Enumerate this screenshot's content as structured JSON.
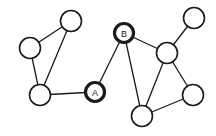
{
  "figure": {
    "background_color": "#ffffff",
    "stroke_color": "#1a1a1a",
    "node_fill_color": "#ffffff",
    "width": 216,
    "height": 136
  },
  "graph": {
    "node_radius": 10.5,
    "highlighted_node_radius": 9.5,
    "nodes": [
      {
        "id": "n1",
        "label": "",
        "x": 71,
        "y": 21,
        "style": "plain",
        "stroke_width": 1.6
      },
      {
        "id": "n2",
        "label": "",
        "x": 30,
        "y": 48,
        "style": "plain",
        "stroke_width": 1.6
      },
      {
        "id": "n3",
        "label": "",
        "x": 40,
        "y": 95,
        "style": "plain",
        "stroke_width": 1.6
      },
      {
        "id": "A",
        "label": "A",
        "x": 95,
        "y": 92,
        "style": "highlighted",
        "stroke_width": 3.2
      },
      {
        "id": "B",
        "label": "B",
        "x": 124,
        "y": 33,
        "style": "highlighted",
        "stroke_width": 3.2
      },
      {
        "id": "n4",
        "label": "",
        "x": 167,
        "y": 53,
        "style": "plain",
        "stroke_width": 1.6
      },
      {
        "id": "n5",
        "label": "",
        "x": 194,
        "y": 18,
        "style": "plain",
        "stroke_width": 1.6
      },
      {
        "id": "n6",
        "label": "",
        "x": 193,
        "y": 95,
        "style": "plain",
        "stroke_width": 1.6
      },
      {
        "id": "n7",
        "label": "",
        "x": 142,
        "y": 116,
        "style": "plain",
        "stroke_width": 1.6
      }
    ],
    "edges": [
      {
        "source": "n2",
        "target": "n1"
      },
      {
        "source": "n2",
        "target": "n3"
      },
      {
        "source": "n1",
        "target": "n3"
      },
      {
        "source": "n3",
        "target": "A"
      },
      {
        "source": "A",
        "target": "B"
      },
      {
        "source": "B",
        "target": "n4"
      },
      {
        "source": "B",
        "target": "n7"
      },
      {
        "source": "n4",
        "target": "n5"
      },
      {
        "source": "n4",
        "target": "n6"
      },
      {
        "source": "n4",
        "target": "n7"
      },
      {
        "source": "n7",
        "target": "n6"
      }
    ]
  }
}
